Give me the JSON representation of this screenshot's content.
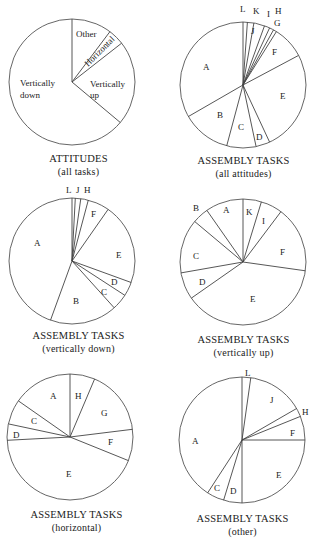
{
  "chart_data": [
    {
      "type": "pie",
      "title": "ATTITUDES",
      "subtitle": "(all tasks)",
      "center": [
        72,
        82
      ],
      "radius": 63,
      "slices": [
        {
          "label": "Other",
          "start": 0,
          "end": 37
        },
        {
          "label": "Horizontal",
          "start": 37,
          "end": 52
        },
        {
          "label": "Vertically up",
          "start": 52,
          "end": 130
        },
        {
          "label": "Vertically down",
          "start": 130,
          "end": 360
        }
      ],
      "approx_percent": {
        "Other": 10,
        "Horizontal": 4,
        "Vertically up": 22,
        "Vertically down": 64
      }
    },
    {
      "type": "pie",
      "title": "ASSEMBLY TASKS",
      "subtitle": "(all attitudes)",
      "center": [
        243,
        85
      ],
      "radius": 63,
      "slices": [
        {
          "label": "L",
          "start": 0,
          "end": 4
        },
        {
          "label": "K",
          "start": 4,
          "end": 10
        },
        {
          "label": "J",
          "start": 10,
          "end": 20
        },
        {
          "label": "I",
          "start": 20,
          "end": 25
        },
        {
          "label": "H",
          "start": 25,
          "end": 29
        },
        {
          "label": "G",
          "start": 29,
          "end": 32
        },
        {
          "label": "F",
          "start": 32,
          "end": 62
        },
        {
          "label": "E",
          "start": 62,
          "end": 155
        },
        {
          "label": "D",
          "start": 155,
          "end": 168
        },
        {
          "label": "C",
          "start": 168,
          "end": 195
        },
        {
          "label": "B",
          "start": 195,
          "end": 240
        },
        {
          "label": "A",
          "start": 240,
          "end": 360
        }
      ]
    },
    {
      "type": "pie",
      "title": "ASSEMBLY TASKS",
      "subtitle": "(vertically down)",
      "center": [
        72,
        261
      ],
      "radius": 63,
      "slices": [
        {
          "label": "L",
          "start": 0,
          "end": 3
        },
        {
          "label": "J",
          "start": 3,
          "end": 8
        },
        {
          "label": "H",
          "start": 8,
          "end": 15
        },
        {
          "label": "F",
          "start": 15,
          "end": 35
        },
        {
          "label": "E",
          "start": 35,
          "end": 110
        },
        {
          "label": "D",
          "start": 110,
          "end": 123
        },
        {
          "label": "C",
          "start": 123,
          "end": 138
        },
        {
          "label": "B",
          "start": 138,
          "end": 200
        },
        {
          "label": "A",
          "start": 200,
          "end": 360
        }
      ]
    },
    {
      "type": "pie",
      "title": "ASSEMBLY TASKS",
      "subtitle": "(vertically up)",
      "center": [
        243,
        262
      ],
      "radius": 63,
      "slices": [
        {
          "label": "K",
          "start": 0,
          "end": 17
        },
        {
          "label": "I",
          "start": 17,
          "end": 37
        },
        {
          "label": "F",
          "start": 37,
          "end": 98
        },
        {
          "label": "E",
          "start": 98,
          "end": 235
        },
        {
          "label": "D",
          "start": 235,
          "end": 260
        },
        {
          "label": "C",
          "start": 260,
          "end": 310
        },
        {
          "label": "B",
          "start": 310,
          "end": 325
        },
        {
          "label": "A",
          "start": 325,
          "end": 360
        }
      ]
    },
    {
      "type": "pie",
      "title": "ASSEMBLY TASKS",
      "subtitle": "(horizontal)",
      "center": [
        70,
        437
      ],
      "radius": 63,
      "slices": [
        {
          "label": "H",
          "start": 0,
          "end": 23
        },
        {
          "label": "G",
          "start": 23,
          "end": 83
        },
        {
          "label": "F",
          "start": 83,
          "end": 112
        },
        {
          "label": "E",
          "start": 112,
          "end": 267
        },
        {
          "label": "D",
          "start": 267,
          "end": 282
        },
        {
          "label": "C",
          "start": 282,
          "end": 305
        },
        {
          "label": "A",
          "start": 305,
          "end": 360
        }
      ]
    },
    {
      "type": "pie",
      "title": "ASSEMBLY TASKS",
      "subtitle": "(other)",
      "center": [
        242,
        440
      ],
      "radius": 63,
      "slices": [
        {
          "label": "L",
          "start": 0,
          "end": 8
        },
        {
          "label": "J",
          "start": 8,
          "end": 60
        },
        {
          "label": "H",
          "start": 60,
          "end": 68
        },
        {
          "label": "F",
          "start": 68,
          "end": 90
        },
        {
          "label": "E",
          "start": 90,
          "end": 180
        },
        {
          "label": "D",
          "start": 180,
          "end": 197
        },
        {
          "label": "C",
          "start": 197,
          "end": 213
        },
        {
          "label": "A",
          "start": 213,
          "end": 360
        }
      ]
    }
  ],
  "titles": [
    {
      "t1": "ATTITUDES",
      "t2": "(all tasks)"
    },
    {
      "t1": "ASSEMBLY TASKS",
      "t2": "(all attitudes)"
    },
    {
      "t1": "ASSEMBLY TASKS",
      "t2": "(vertically down)"
    },
    {
      "t1": "ASSEMBLY TASKS",
      "t2": "(vertically up)"
    },
    {
      "t1": "ASSEMBLY TASKS",
      "t2": "(horizontal)"
    },
    {
      "t1": "ASSEMBLY TASKS",
      "t2": "(other)"
    }
  ],
  "labels": {
    "c1": {
      "other": "Other",
      "horizontal": "Horizontal",
      "vup1": "Vertically",
      "vup2": "up",
      "vdown1": "Vertically",
      "vdown2": "down"
    },
    "c2": {
      "L": "L",
      "K": "K",
      "I": "I",
      "H": "H",
      "J": "J",
      "G": "G",
      "F": "F",
      "E": "E",
      "D": "D",
      "C": "C",
      "B": "B",
      "A": "A"
    },
    "c3": {
      "L": "L",
      "J": "J",
      "H": "H",
      "F": "F",
      "E": "E",
      "D": "D",
      "C": "C",
      "B": "B",
      "A": "A"
    },
    "c4": {
      "K": "K",
      "I": "I",
      "F": "F",
      "E": "E",
      "D": "D",
      "C": "C",
      "B": "B",
      "A": "A"
    },
    "c5": {
      "H": "H",
      "G": "G",
      "F": "F",
      "E": "E",
      "D": "D",
      "C": "C",
      "A": "A"
    },
    "c6": {
      "L": "L",
      "J": "J",
      "H": "H",
      "F": "F",
      "E": "E",
      "D": "D",
      "C": "C",
      "A": "A"
    }
  }
}
